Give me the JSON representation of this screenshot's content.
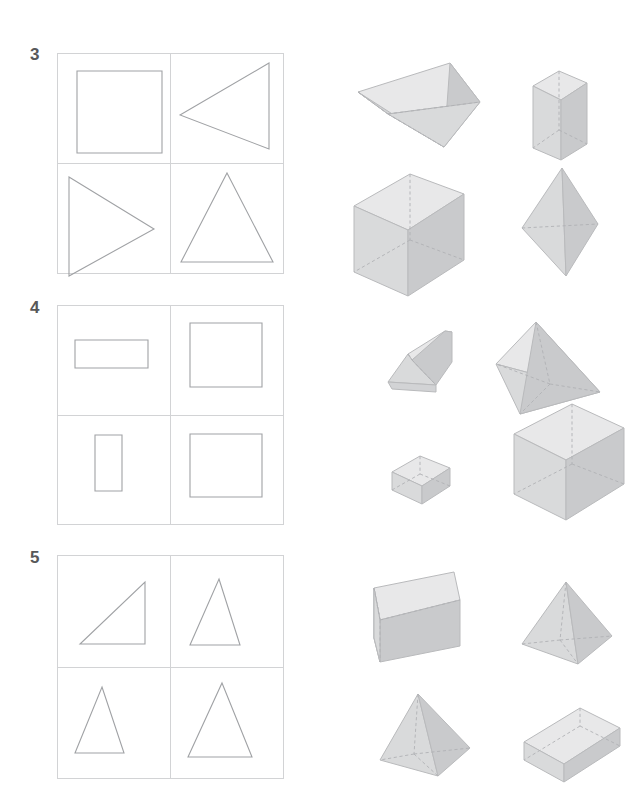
{
  "page": {
    "width": 642,
    "height": 809,
    "background": "#ffffff"
  },
  "palette": {
    "label_color": "#58585a",
    "grid_line": "#d2d3d5",
    "flat_shape_stroke": "#a0a2a5",
    "solid_stroke": "#b9babc",
    "face_top": "#e8e8e9",
    "face_left": "#d9dadb",
    "face_right": "#c9cacc",
    "face_front": "#d2d3d5",
    "hidden_edge": "#b0b1b4"
  },
  "exercises": [
    {
      "number": "3",
      "label_x": 30,
      "label_y": 48,
      "grid": {
        "x": 57,
        "y": 53,
        "w": 226,
        "h": 220
      },
      "flat_shapes": [
        {
          "name": "square",
          "cell": "top-left",
          "points": "20,18 105,18 105,100 20,100"
        },
        {
          "name": "triangle-pointing-left",
          "cell": "top-right",
          "points": "10,62 99,10 99,111"
        },
        {
          "name": "triangle-pointing-right",
          "cell": "bottom-left",
          "points": "12,12 97,68 12,118"
        },
        {
          "name": "triangle-isosceles-up",
          "cell": "bottom-right",
          "points": "57,10 103,104 11,104"
        }
      ],
      "solids": [
        {
          "name": "triangular-prism-tilted",
          "x": 352,
          "y": 55,
          "w": 130,
          "h": 110
        },
        {
          "name": "tall-rectangular-prism",
          "x": 529,
          "y": 68,
          "w": 70,
          "h": 92
        },
        {
          "name": "cube",
          "x": 352,
          "y": 172,
          "w": 112,
          "h": 108
        },
        {
          "name": "tall-tetrahedron",
          "x": 520,
          "y": 168,
          "w": 90,
          "h": 112
        }
      ]
    },
    {
      "number": "4",
      "label_x": 30,
      "label_y": 302,
      "grid": {
        "x": 57,
        "y": 305,
        "w": 226,
        "h": 219
      },
      "flat_shapes": [
        {
          "name": "rectangle-wide",
          "cell": "top-left",
          "points": "20,34 105,34 105,59 20,59"
        },
        {
          "name": "square-large",
          "cell": "top-right",
          "points": "14,14 108,14 108,106 14,106"
        },
        {
          "name": "rectangle-tall",
          "cell": "bottom-left",
          "points": "38,27 88,27 88,110 38,110"
        },
        {
          "name": "square-large-2",
          "cell": "bottom-right",
          "points": "14,26 108,26 108,116 14,116"
        }
      ],
      "solids": [
        {
          "name": "wedge-prism",
          "x": 382,
          "y": 325,
          "w": 85,
          "h": 70
        },
        {
          "name": "tetrahedron-wide",
          "x": 494,
          "y": 315,
          "w": 146,
          "h": 90
        },
        {
          "name": "flat-box-small",
          "x": 392,
          "y": 445,
          "w": 70,
          "h": 50
        },
        {
          "name": "rectangular-prism-upright",
          "x": 508,
          "y": 425,
          "w": 105,
          "h": 95
        }
      ]
    },
    {
      "number": "5",
      "label_x": 30,
      "label_y": 552,
      "grid": {
        "x": 57,
        "y": 555,
        "w": 226,
        "h": 223
      },
      "flat_shapes": [
        {
          "name": "right-triangle",
          "cell": "top-left",
          "points": "29,92 86,92 86,32"
        },
        {
          "name": "triangle-isosceles-up-1",
          "cell": "top-right",
          "points": "56,12 92,92 17,92"
        },
        {
          "name": "triangle-isosceles-up-2",
          "cell": "bottom-left",
          "points": "53,14 88,94 19,94"
        },
        {
          "name": "triangle-isosceles-up-3",
          "cell": "bottom-right",
          "points": "56,8 100,100 10,100"
        }
      ],
      "solids": [
        {
          "name": "triangular-prism-wide",
          "x": 372,
          "y": 570,
          "w": 122,
          "h": 105
        },
        {
          "name": "square-pyramid-tall",
          "x": 520,
          "y": 572,
          "w": 92,
          "h": 110
        },
        {
          "name": "square-pyramid-short",
          "x": 372,
          "y": 690,
          "w": 100,
          "h": 95
        },
        {
          "name": "flat-box-wide",
          "x": 520,
          "y": 700,
          "w": 98,
          "h": 68
        }
      ]
    }
  ]
}
